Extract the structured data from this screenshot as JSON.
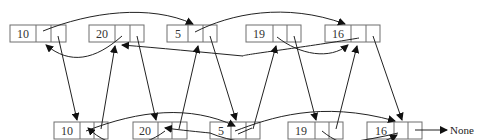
{
  "diagram": {
    "title": "",
    "top_row": [
      {
        "id": "t0",
        "value": "10"
      },
      {
        "id": "t1",
        "value": "20"
      },
      {
        "id": "t2",
        "value": "5"
      },
      {
        "id": "t3",
        "value": "19"
      },
      {
        "id": "t4",
        "value": "16"
      }
    ],
    "bottom_row": [
      {
        "id": "b0",
        "value": "10"
      },
      {
        "id": "b1",
        "value": "20"
      },
      {
        "id": "b2",
        "value": "5"
      },
      {
        "id": "b3",
        "value": "19"
      },
      {
        "id": "b4",
        "value": "16"
      }
    ],
    "terminal": {
      "label": "None"
    },
    "colors": {
      "box_stroke": "#6e6e6e",
      "edge": "#222222",
      "text": "#333333",
      "background": "#ffffff"
    }
  }
}
